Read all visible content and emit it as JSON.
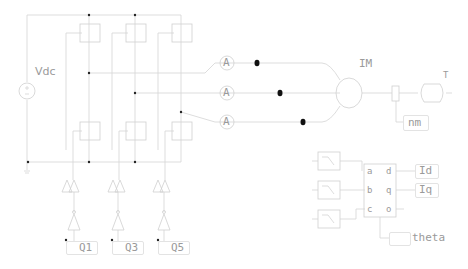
{
  "schematic": {
    "source": {
      "label": "Vdc"
    },
    "gate_labels": [
      "Q1",
      "Q3",
      "Q5"
    ],
    "ammeters": [
      {
        "label": "A"
      },
      {
        "label": "A"
      },
      {
        "label": "A"
      }
    ],
    "motor": {
      "label": "IM"
    },
    "load": {
      "label": "T"
    },
    "speed_output": {
      "label": "nm"
    },
    "transform": {
      "inputs": [
        "a",
        "b",
        "c"
      ],
      "outputs": [
        "d",
        "q",
        "o"
      ]
    },
    "outputs": {
      "id": "Id",
      "iq": "Iq",
      "theta": "theta"
    }
  },
  "colors": {
    "wire": "#d4d4d4",
    "label": "#9a9a9a",
    "node": "#000000"
  }
}
